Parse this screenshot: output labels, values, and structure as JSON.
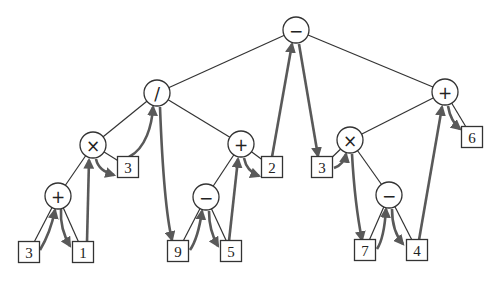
{
  "diagram": {
    "type": "expression-tree-traversal",
    "colors": {
      "edge": "#333333",
      "traversal_arrow": "#595959",
      "background": "#ffffff"
    },
    "nodes": [
      {
        "id": "n-root",
        "kind": "operator",
        "label": "−",
        "x": 296,
        "y": 30
      },
      {
        "id": "n-div",
        "kind": "operator",
        "label": "/",
        "x": 157,
        "y": 93
      },
      {
        "id": "n-plus-r",
        "kind": "operator",
        "label": "+",
        "x": 445,
        "y": 92
      },
      {
        "id": "n-times-l",
        "kind": "operator",
        "label": "×",
        "x": 93,
        "y": 145
      },
      {
        "id": "n-plus-m",
        "kind": "operator",
        "label": "+",
        "x": 241,
        "y": 144
      },
      {
        "id": "n-times-r",
        "kind": "operator",
        "label": "×",
        "x": 350,
        "y": 140
      },
      {
        "id": "n-plus-l",
        "kind": "operator",
        "label": "+",
        "x": 58,
        "y": 196
      },
      {
        "id": "n-minus-m",
        "kind": "operator",
        "label": "−",
        "x": 206,
        "y": 197
      },
      {
        "id": "n-minus-r",
        "kind": "operator",
        "label": "−",
        "x": 389,
        "y": 195
      },
      {
        "id": "n-3a",
        "kind": "operand",
        "label": "3",
        "x": 29,
        "y": 252
      },
      {
        "id": "n-1",
        "kind": "operand",
        "label": "1",
        "x": 83,
        "y": 252
      },
      {
        "id": "n-3b",
        "kind": "operand",
        "label": "3",
        "x": 128,
        "y": 167
      },
      {
        "id": "n-9",
        "kind": "operand",
        "label": "9",
        "x": 178,
        "y": 251
      },
      {
        "id": "n-5",
        "kind": "operand",
        "label": "5",
        "x": 231,
        "y": 251
      },
      {
        "id": "n-2",
        "kind": "operand",
        "label": "2",
        "x": 272,
        "y": 167
      },
      {
        "id": "n-3c",
        "kind": "operand",
        "label": "3",
        "x": 322,
        "y": 167
      },
      {
        "id": "n-7",
        "kind": "operand",
        "label": "7",
        "x": 365,
        "y": 250
      },
      {
        "id": "n-4",
        "kind": "operand",
        "label": "4",
        "x": 417,
        "y": 250
      },
      {
        "id": "n-6",
        "kind": "operand",
        "label": "6",
        "x": 472,
        "y": 137
      }
    ],
    "edges": [
      [
        "n-root",
        "n-div"
      ],
      [
        "n-root",
        "n-plus-r"
      ],
      [
        "n-div",
        "n-times-l"
      ],
      [
        "n-div",
        "n-plus-m"
      ],
      [
        "n-times-l",
        "n-plus-l"
      ],
      [
        "n-times-l",
        "n-3b"
      ],
      [
        "n-plus-l",
        "n-3a"
      ],
      [
        "n-plus-l",
        "n-1"
      ],
      [
        "n-plus-m",
        "n-minus-m"
      ],
      [
        "n-plus-m",
        "n-2"
      ],
      [
        "n-minus-m",
        "n-9"
      ],
      [
        "n-minus-m",
        "n-5"
      ],
      [
        "n-plus-r",
        "n-times-r"
      ],
      [
        "n-plus-r",
        "n-6"
      ],
      [
        "n-times-r",
        "n-3c"
      ],
      [
        "n-times-r",
        "n-minus-r"
      ],
      [
        "n-minus-r",
        "n-7"
      ],
      [
        "n-minus-r",
        "n-4"
      ]
    ],
    "expression": "((3 + 1) × 3) / ((9 − 5) + 2) − ((3 × (7 − 4)) + 6)"
  }
}
